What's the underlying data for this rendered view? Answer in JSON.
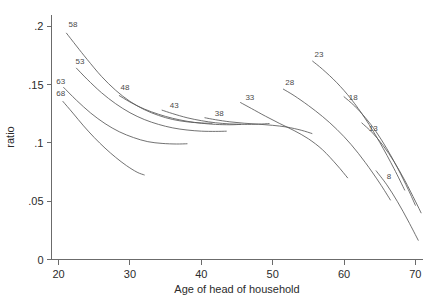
{
  "chart_data": {
    "type": "line",
    "title": "",
    "xlabel": "Age of head of household",
    "ylabel": "ratio",
    "xlim": [
      19,
      71
    ],
    "ylim": [
      0,
      0.21
    ],
    "grid": false,
    "legend_position": "inline-curve-labels",
    "xticks": [
      20,
      30,
      40,
      50,
      60,
      70
    ],
    "xtick_labels": [
      "20",
      "30",
      "40",
      "50",
      "60",
      "70"
    ],
    "yticks": [
      0,
      0.05,
      0.1,
      0.15,
      0.2
    ],
    "ytick_labels": [
      "0",
      ".05",
      ".1",
      ".15",
      ".2"
    ],
    "series": [
      {
        "name": "68",
        "label": "68",
        "label_x": 20.3,
        "label_y": 0.1405,
        "x": [
          20.6,
          22.0,
          23.5,
          25.0,
          26.5,
          28.0,
          29.5,
          31.0,
          32.0
        ],
        "values": [
          0.1355,
          0.1255,
          0.1145,
          0.1045,
          0.0955,
          0.0875,
          0.0805,
          0.0748,
          0.0725
        ]
      },
      {
        "name": "63",
        "label": "63",
        "label_x": 20.3,
        "label_y": 0.1505,
        "x": [
          20.7,
          22.5,
          24.5,
          26.5,
          28.5,
          30.5,
          32.5,
          34.5,
          36.5,
          38.0
        ],
        "values": [
          0.1475,
          0.1365,
          0.1255,
          0.1165,
          0.1095,
          0.1045,
          0.101,
          0.0995,
          0.099,
          0.0992
        ]
      },
      {
        "name": "58",
        "label": "58",
        "label_x": 22.0,
        "label_y": 0.1995,
        "x": [
          21.1,
          22.5,
          24.0,
          26.0,
          28.0,
          30.0,
          32.0,
          34.0,
          36.0,
          38.0,
          40.0,
          41.5
        ],
        "values": [
          0.194,
          0.183,
          0.1715,
          0.157,
          0.145,
          0.1355,
          0.1285,
          0.1235,
          0.12,
          0.118,
          0.117,
          0.1168
        ]
      },
      {
        "name": "53",
        "label": "53",
        "label_x": 23.0,
        "label_y": 0.168,
        "x": [
          22.5,
          24.0,
          26.0,
          28.0,
          30.0,
          32.0,
          34.0,
          36.0,
          38.0,
          40.0,
          42.0,
          43.5
        ],
        "values": [
          0.164,
          0.1545,
          0.143,
          0.1335,
          0.1258,
          0.12,
          0.1158,
          0.1128,
          0.111,
          0.11,
          0.1098,
          0.11
        ]
      },
      {
        "name": "48",
        "label": "48",
        "label_x": 29.3,
        "label_y": 0.1455,
        "x": [
          28.5,
          30.0,
          32.0,
          34.0,
          36.0,
          38.0,
          40.0,
          42.0,
          44.0,
          45.5
        ],
        "values": [
          0.1405,
          0.135,
          0.129,
          0.1245,
          0.121,
          0.1185,
          0.1168,
          0.1158,
          0.1155,
          0.1158
        ]
      },
      {
        "name": "43",
        "label": "43",
        "label_x": 36.2,
        "label_y": 0.1295,
        "x": [
          34.5,
          36.0,
          38.0,
          40.0,
          42.0,
          44.0,
          46.0,
          48.0,
          49.5
        ],
        "values": [
          0.128,
          0.125,
          0.1215,
          0.119,
          0.1172,
          0.1162,
          0.1158,
          0.116,
          0.1165
        ]
      },
      {
        "name": "38",
        "label": "38",
        "label_x": 42.5,
        "label_y": 0.1228,
        "x": [
          40.5,
          42.0,
          44.0,
          46.0,
          48.0,
          50.0,
          52.0,
          54.0,
          55.5
        ],
        "values": [
          0.1215,
          0.1198,
          0.118,
          0.1168,
          0.116,
          0.115,
          0.1135,
          0.1108,
          0.108
        ]
      },
      {
        "name": "33",
        "label": "33",
        "label_x": 46.8,
        "label_y": 0.137,
        "x": [
          45.5,
          47.0,
          49.0,
          51.0,
          53.0,
          55.0,
          57.0,
          59.0,
          60.5
        ],
        "values": [
          0.1345,
          0.1295,
          0.1228,
          0.1165,
          0.1105,
          0.1035,
          0.094,
          0.081,
          0.07
        ]
      },
      {
        "name": "28",
        "label": "28",
        "label_x": 52.4,
        "label_y": 0.1495,
        "x": [
          51.5,
          53.0,
          55.0,
          57.0,
          59.0,
          61.0,
          63.0,
          65.0,
          66.5
        ],
        "values": [
          0.146,
          0.1405,
          0.132,
          0.1225,
          0.1115,
          0.0985,
          0.083,
          0.0655,
          0.051
        ]
      },
      {
        "name": "23",
        "label": "23",
        "label_x": 56.5,
        "label_y": 0.1735,
        "x": [
          55.6,
          57.0,
          59.0,
          61.0,
          63.0,
          65.0,
          67.0,
          68.5
        ],
        "values": [
          0.17,
          0.163,
          0.1515,
          0.1375,
          0.1205,
          0.1005,
          0.078,
          0.0595
        ]
      },
      {
        "name": "18",
        "label": "18",
        "label_x": 61.3,
        "label_y": 0.137,
        "x": [
          60.0,
          61.5,
          63.0,
          64.5,
          66.0,
          67.5,
          69.0,
          70.0
        ],
        "values": [
          0.1395,
          0.1315,
          0.1215,
          0.1095,
          0.095,
          0.0785,
          0.06,
          0.0465
        ]
      },
      {
        "name": "13",
        "label": "13",
        "label_x": 64.1,
        "label_y": 0.1105,
        "x": [
          62.5,
          64.0,
          65.5,
          67.0,
          68.5,
          70.0,
          70.8
        ],
        "values": [
          0.117,
          0.1085,
          0.0975,
          0.084,
          0.068,
          0.05,
          0.04
        ]
      },
      {
        "name": "8",
        "label": "8",
        "label_x": 66.3,
        "label_y": 0.069,
        "x": [
          64.5,
          66.0,
          67.5,
          69.0,
          70.4
        ],
        "values": [
          0.076,
          0.064,
          0.0495,
          0.033,
          0.0165
        ]
      }
    ]
  }
}
